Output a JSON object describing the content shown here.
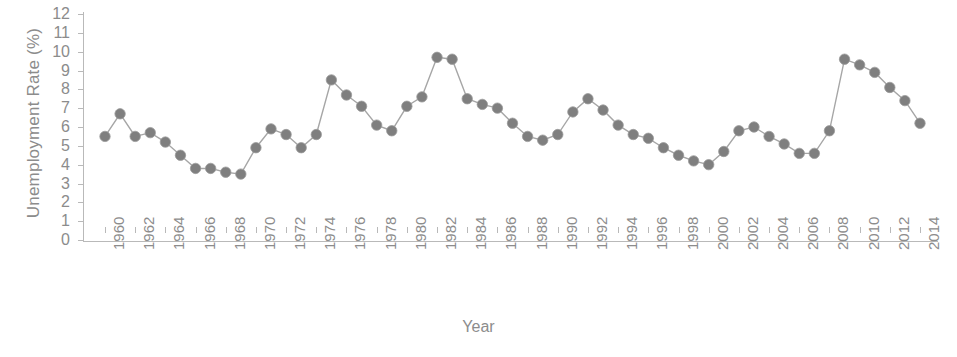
{
  "chart_data": {
    "type": "line",
    "title": "",
    "xlabel": "Year",
    "ylabel": "Unemployment Rate (%)",
    "xlim": [
      1960,
      2014
    ],
    "ylim": [
      0,
      12
    ],
    "grid": false,
    "legend": null,
    "y_ticks": [
      0,
      1,
      2,
      3,
      4,
      5,
      6,
      7,
      8,
      9,
      10,
      11,
      12
    ],
    "y_tick_labels": [
      "0",
      "1",
      "2",
      "3",
      "4",
      "5",
      "6",
      "7",
      "8",
      "9",
      "10",
      "11",
      "12"
    ],
    "x_ticks": [
      1960,
      1962,
      1964,
      1966,
      1968,
      1970,
      1972,
      1974,
      1976,
      1978,
      1980,
      1982,
      1984,
      1986,
      1988,
      1990,
      1992,
      1994,
      1996,
      1998,
      2000,
      2002,
      2004,
      2006,
      2008,
      2010,
      2012,
      2014
    ],
    "x_tick_labels": [
      "1960",
      "1962",
      "1964",
      "1966",
      "1968",
      "1970",
      "1972",
      "1974",
      "1976",
      "1978",
      "1980",
      "1982",
      "1984",
      "1986",
      "1988",
      "1990",
      "1992",
      "1994",
      "1996",
      "1998",
      "2000",
      "2002",
      "2004",
      "2006",
      "2008",
      "2010",
      "2012",
      "2014"
    ],
    "marker": "circle",
    "marker_color": "#7f7f7f",
    "line_color": "#a6a6a6",
    "axis_color": "#b9b9b9",
    "text_color": "#8c8c8c",
    "x": [
      1960,
      1961,
      1962,
      1963,
      1964,
      1965,
      1966,
      1967,
      1968,
      1969,
      1970,
      1971,
      1972,
      1973,
      1974,
      1975,
      1976,
      1977,
      1978,
      1979,
      1980,
      1981,
      1982,
      1983,
      1984,
      1985,
      1986,
      1987,
      1988,
      1989,
      1990,
      1991,
      1992,
      1993,
      1994,
      1995,
      1996,
      1997,
      1998,
      1999,
      2000,
      2001,
      2002,
      2003,
      2004,
      2005,
      2006,
      2007,
      2008,
      2009,
      2010,
      2011,
      2012,
      2013,
      2014
    ],
    "values": [
      5.5,
      6.7,
      5.5,
      5.7,
      5.2,
      4.5,
      3.8,
      3.8,
      3.6,
      3.5,
      4.9,
      5.9,
      5.6,
      4.9,
      5.6,
      8.5,
      7.7,
      7.1,
      6.1,
      5.8,
      7.1,
      7.6,
      9.7,
      9.6,
      7.5,
      7.2,
      7.0,
      6.2,
      5.5,
      5.3,
      5.6,
      6.8,
      7.5,
      6.9,
      6.1,
      5.6,
      5.4,
      4.9,
      4.5,
      4.2,
      4.0,
      4.7,
      5.8,
      6.0,
      5.5,
      5.1,
      4.6,
      4.6,
      5.8,
      9.6,
      9.3,
      8.9,
      8.1,
      7.4,
      6.2
    ]
  }
}
